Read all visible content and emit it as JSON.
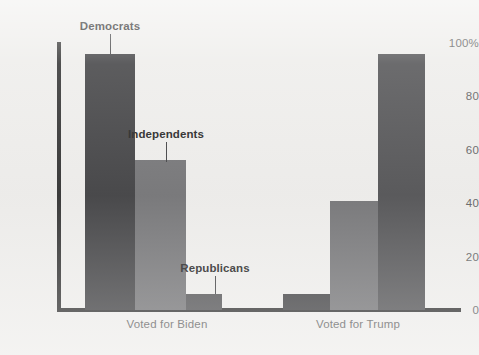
{
  "chart_data": {
    "type": "bar",
    "title": "",
    "subtitle": "",
    "xlabel": "",
    "ylabel": "",
    "ylim": [
      0,
      100
    ],
    "grid": false,
    "legend_position": "inline-annotations",
    "categories": [
      "Voted for Biden",
      "Voted for Trump"
    ],
    "series": [
      {
        "name": "Democrats",
        "color": "#4a4a4c",
        "values": [
          96,
          6
        ]
      },
      {
        "name": "Independents",
        "color": "#7b7b7d",
        "values": [
          56,
          41
        ]
      },
      {
        "name": "Republicans",
        "color": "#5b5b5d",
        "values": [
          6,
          96
        ]
      }
    ],
    "y_ticks": [
      {
        "value": 100,
        "label": "100%"
      },
      {
        "value": 80,
        "label": "80"
      },
      {
        "value": 60,
        "label": "60"
      },
      {
        "value": 40,
        "label": "40"
      },
      {
        "value": 20,
        "label": "20"
      },
      {
        "value": 0,
        "label": "0"
      }
    ],
    "annotations": [
      {
        "label": "Democrats",
        "points_to_series": "Democrats",
        "points_to_category": "Voted for Biden"
      },
      {
        "label": "Independents",
        "points_to_series": "Independents",
        "points_to_category": "Voted for Biden"
      },
      {
        "label": "Republicans",
        "points_to_series": "Republicans",
        "points_to_category": "Voted for Biden"
      }
    ]
  },
  "axis": {
    "tick_100": "100%",
    "tick_80": "80",
    "tick_60": "60",
    "tick_40": "40",
    "tick_20": "20",
    "tick_0": "0"
  },
  "categories": {
    "biden": "Voted for Biden",
    "trump": "Voted for Trump"
  },
  "annotations": {
    "democrats": "Democrats",
    "independents": "Independents",
    "republicans": "Republicans"
  },
  "colors": {
    "background": "#efeeec",
    "axis": "#3c3c3c",
    "democrats": "#4a4a4c",
    "independents": "#7b7b7d",
    "republicans": "#5b5b5d",
    "tick_text": "#6b6b6b",
    "annotation_text": "#2f2f2f"
  }
}
